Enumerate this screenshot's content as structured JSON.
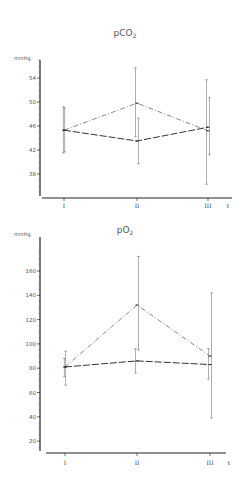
{
  "chart_data": [
    {
      "type": "line",
      "title": "pCO2",
      "title_main": "pCO",
      "title_sub": "2",
      "ylabel": "mmHg",
      "xlabel": "t",
      "categories": [
        "I",
        "II",
        "III"
      ],
      "yticks": [
        38,
        42,
        46,
        50,
        54
      ],
      "ylim": [
        34,
        57
      ],
      "grid": false,
      "legend": null,
      "series": [
        {
          "name": "series-dash-dot",
          "style": "dash-dot",
          "values": [
            45.3,
            49.8,
            45.2
          ],
          "error_low": [
            41.5,
            44.2,
            36.3
          ],
          "error_high": [
            49.2,
            55.7,
            53.7
          ]
        },
        {
          "name": "series-long-dash",
          "style": "long-dash",
          "values": [
            45.3,
            43.5,
            45.8
          ],
          "error_low": [
            41.7,
            39.7,
            41.2
          ],
          "error_high": [
            49.0,
            47.3,
            50.7
          ]
        }
      ]
    },
    {
      "type": "line",
      "title": "pO2",
      "title_main": "pO",
      "title_sub": "2",
      "ylabel": "mmHg",
      "xlabel": "t",
      "categories": [
        "I",
        "II",
        "III"
      ],
      "yticks": [
        20,
        40,
        60,
        80,
        100,
        120,
        140,
        160
      ],
      "ylim": [
        10,
        175
      ],
      "grid": false,
      "legend": null,
      "series": [
        {
          "name": "series-dash-dot",
          "style": "dash-dot",
          "values": [
            81,
            132,
            90
          ],
          "error_low": [
            66,
            95,
            39
          ],
          "error_high": [
            94,
            172,
            142
          ]
        },
        {
          "name": "series-long-dash",
          "style": "long-dash",
          "values": [
            81,
            86,
            83
          ],
          "error_low": [
            73,
            76,
            71
          ],
          "error_high": [
            88,
            96,
            96
          ]
        }
      ]
    }
  ]
}
